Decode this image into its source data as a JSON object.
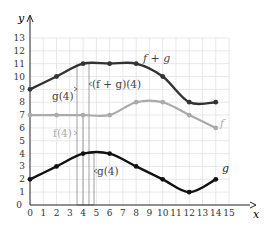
{
  "chart_data": {
    "type": "line",
    "title": "",
    "xlabel": "x",
    "ylabel": "y",
    "xlim": [
      0,
      15
    ],
    "ylim": [
      0,
      13
    ],
    "grid": true,
    "x_ticks": [
      "0",
      "1",
      "2",
      "3",
      "4",
      "5",
      "6",
      "7",
      "8",
      "9",
      "10",
      "11",
      "12",
      "13",
      "14",
      "15"
    ],
    "y_ticks": [
      "0",
      "1",
      "2",
      "3",
      "4",
      "5",
      "6",
      "7",
      "8",
      "9",
      "10",
      "11",
      "12",
      "13"
    ],
    "series": [
      {
        "name": "f + g",
        "label": "f + g",
        "color": "#333333",
        "points": [
          [
            0,
            9
          ],
          [
            2,
            10
          ],
          [
            4,
            11
          ],
          [
            6,
            11
          ],
          [
            8,
            11
          ],
          [
            10,
            10
          ],
          [
            12,
            8
          ],
          [
            14,
            8
          ]
        ]
      },
      {
        "name": "f",
        "label": "f",
        "color": "#aaaaaa",
        "points": [
          [
            0,
            7
          ],
          [
            2,
            7
          ],
          [
            4,
            7
          ],
          [
            6,
            7
          ],
          [
            8,
            8
          ],
          [
            10,
            8
          ],
          [
            12,
            7
          ],
          [
            14,
            6
          ]
        ]
      },
      {
        "name": "g",
        "label": "g",
        "color": "#111111",
        "points": [
          [
            0,
            2
          ],
          [
            2,
            3
          ],
          [
            4,
            4
          ],
          [
            6,
            4
          ],
          [
            8,
            3
          ],
          [
            10,
            2
          ],
          [
            12,
            1
          ],
          [
            14,
            2
          ]
        ]
      }
    ],
    "annotations": [
      {
        "text": "(f + g)(4)",
        "at_x": 4,
        "span": [
          0,
          11
        ]
      },
      {
        "text": "g(4)",
        "at_x": 4,
        "span": [
          7,
          11
        ],
        "side": "left"
      },
      {
        "text": "f(4)",
        "at_x": 4,
        "span": [
          0,
          7
        ],
        "side": "left"
      },
      {
        "text": "g(4)",
        "at_x": 4,
        "span": [
          0,
          4
        ],
        "side": "right"
      }
    ]
  },
  "labels": {
    "x_axis": "x",
    "y_axis": "y",
    "fg": "f + g",
    "f": "f",
    "g": "g",
    "fg4": "(f + g)(4)",
    "g4_top": "g(4)",
    "f4": "f(4)",
    "g4_bottom": "g(4)"
  }
}
